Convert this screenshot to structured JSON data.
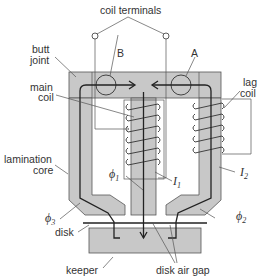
{
  "diagram": {
    "labels": {
      "coil_terminals": "coil terminals",
      "butt_joint_1": "butt",
      "butt_joint_2": "joint",
      "main_coil_1": "main",
      "main_coil_2": "coil",
      "lag_coil_1": "lag",
      "lag_coil_2": "coil",
      "lamination_core_1": "lamination",
      "lamination_core_2": "core",
      "disk": "disk",
      "keeper": "keeper",
      "disk_air_gap": "disk air gap",
      "point_a": "A",
      "point_b": "B"
    },
    "symbols": {
      "phi": "ϕ",
      "phi1_sub": "1",
      "phi2_sub": "2",
      "phi3_sub": "3",
      "I": "I",
      "I1_sub": "1",
      "I2_sub": "2"
    },
    "colors": {
      "core_fill": "#c8c8c8",
      "line": "#333333"
    }
  }
}
